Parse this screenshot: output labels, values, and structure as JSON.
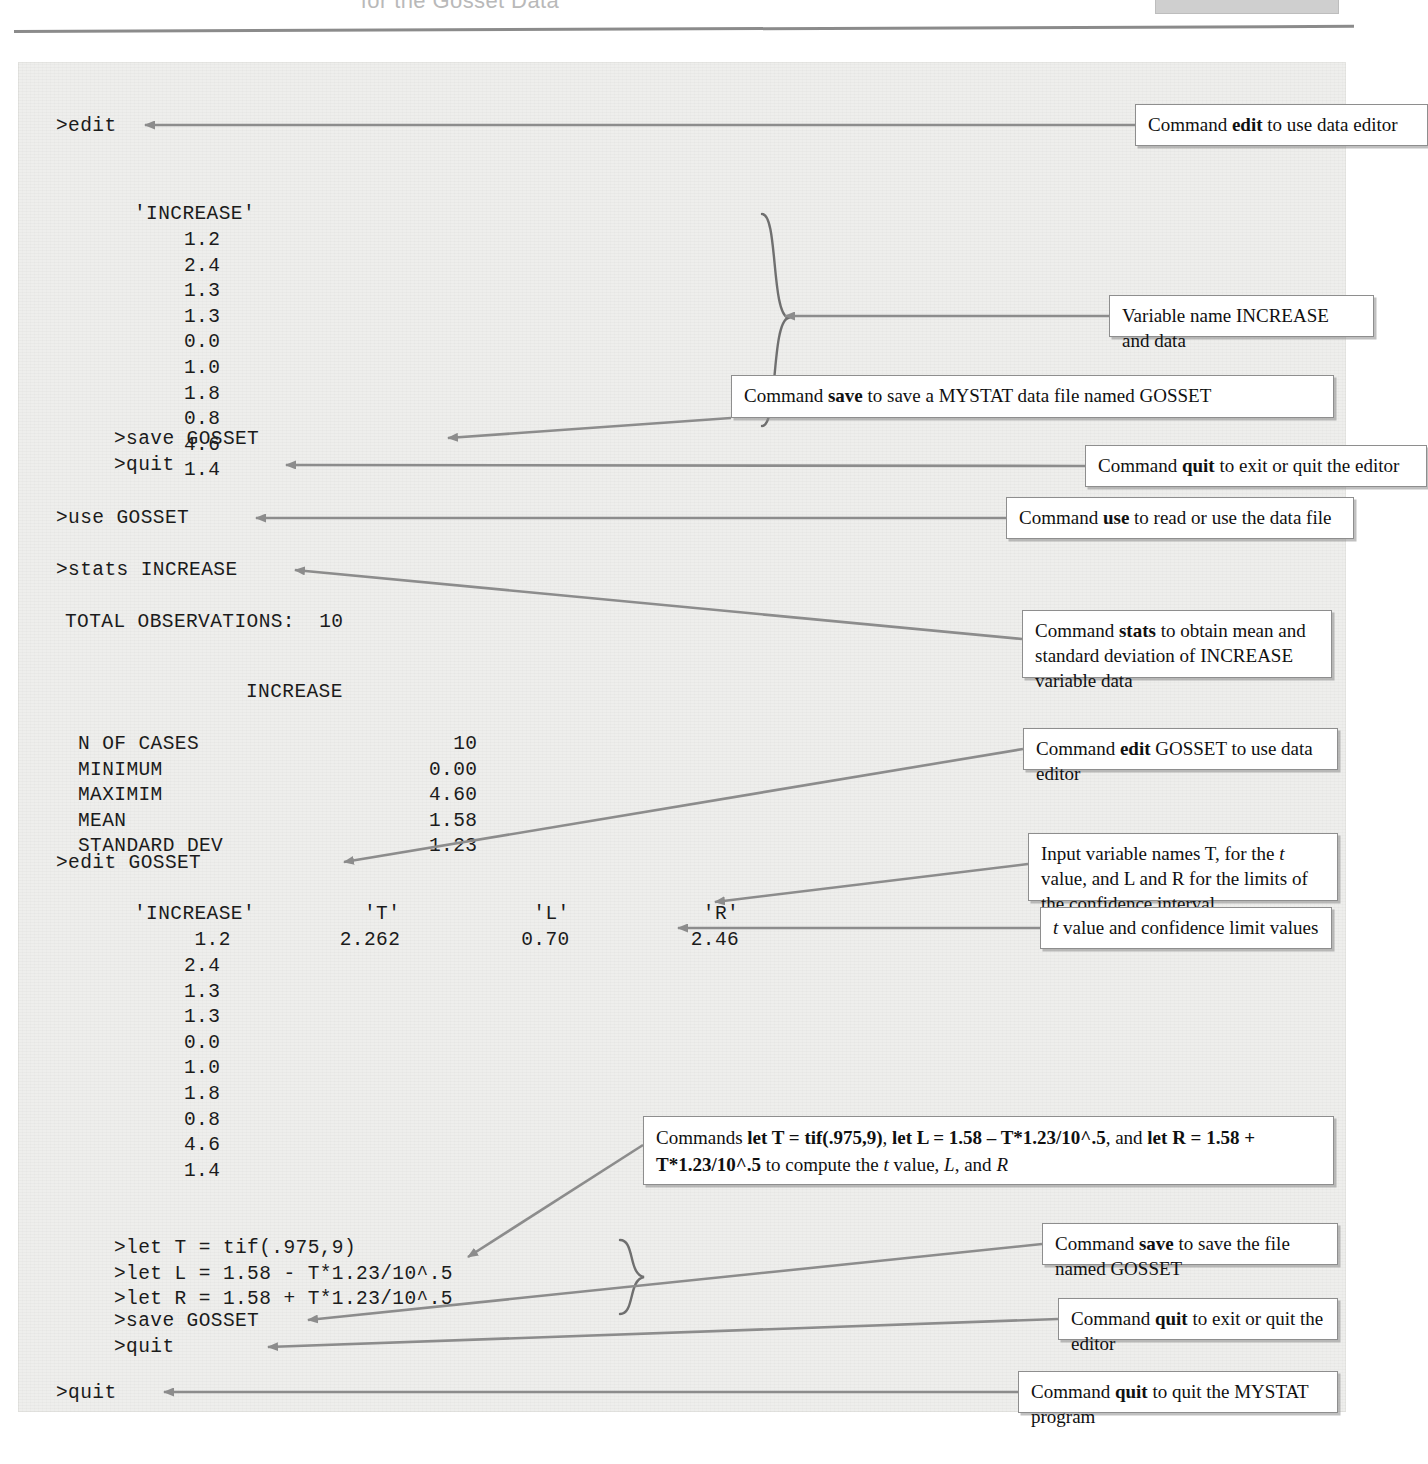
{
  "header": {
    "caption": "for the Gosset Data"
  },
  "terminal": {
    "line_edit": ">edit",
    "block1": {
      "header": "'INCREASE'",
      "values": [
        "1.2",
        "2.4",
        "1.3",
        "1.3",
        "0.0",
        "1.0",
        "1.8",
        "0.8",
        "4.6",
        "1.4"
      ]
    },
    "save_gosset_1": ">save GOSSET",
    "quit_1": ">quit",
    "use_gosset": ">use GOSSET",
    "stats_increase": ">stats INCREASE",
    "total_observations": "TOTAL OBSERVATIONS:  10",
    "stats_column_header": "INCREASE",
    "stats_rows": [
      {
        "label": "N OF CASES",
        "value": "10"
      },
      {
        "label": "MINIMUM",
        "value": "0.00"
      },
      {
        "label": "MAXIMIM",
        "value": "4.60"
      },
      {
        "label": "MEAN",
        "value": "1.58"
      },
      {
        "label": "STANDARD DEV",
        "value": "1.23"
      }
    ],
    "edit_gosset": ">edit GOSSET",
    "block2": {
      "headers": [
        "'INCREASE'",
        "'T'",
        "'L'",
        "'R'"
      ],
      "first_row": [
        "1.2",
        "2.262",
        "0.70",
        "2.46"
      ],
      "increase_rest": [
        "2.4",
        "1.3",
        "1.3",
        "0.0",
        "1.0",
        "1.8",
        "0.8",
        "4.6",
        "1.4"
      ]
    },
    "let_lines": [
      ">let T = tif(.975,9)",
      ">let L = 1.58 - T*1.23/10^.5",
      ">let R = 1.58 + T*1.23/10^.5"
    ],
    "save_gosset_2": ">save GOSSET",
    "quit_2": ">quit",
    "quit_3": ">quit"
  },
  "callouts": {
    "edit_editor": {
      "pre": "Command ",
      "cmd": "edit",
      "post": " to use data editor"
    },
    "variable_data": {
      "text": "Variable name INCREASE and data"
    },
    "save_mystat_file": {
      "pre": "Command ",
      "cmd": "save",
      "post": " to save a MYSTAT data file named GOSSET"
    },
    "quit_editor_1": {
      "pre": "Command ",
      "cmd": "quit",
      "post": " to exit or quit the editor"
    },
    "use_data_file": {
      "pre": "Command ",
      "cmd": "use",
      "post": " to read or use the data file"
    },
    "stats_mean_sd": {
      "pre": "Command ",
      "cmd": "stats",
      "post": " to obtain mean and standard deviation of INCREASE variable data"
    },
    "edit_gosset_editor": {
      "pre": "Command ",
      "cmd": "edit",
      "post": " GOSSET to use data editor"
    },
    "input_variable_names": {
      "seg1": "Input variable names T, for the ",
      "ital1": "t",
      "seg2": " value, and L and R for the limits of the confidence interval"
    },
    "t_and_limits": {
      "ital1": "t",
      "seg1": " value and confidence limit values"
    },
    "let_commands": {
      "seg1": "Commands ",
      "bold1": "let T = tif(.975,9)",
      "seg2": ", ",
      "bold2": "let L = 1.58 – T*1.23/10^.5",
      "seg3": ", and ",
      "bold3": "let R = 1.58 + T*1.23/10^.5",
      "seg4": " to compute the ",
      "ital1": "t",
      "seg5": " value, ",
      "ital2": "L",
      "seg6": ", and ",
      "ital3": "R"
    },
    "save_named_gosset": {
      "pre": "Command ",
      "cmd": "save",
      "post": " to save the file named GOSSET"
    },
    "quit_editor_2": {
      "pre": "Command ",
      "cmd": "quit",
      "post": " to exit or quit the editor"
    },
    "quit_program": {
      "pre": "Command ",
      "cmd": "quit",
      "post": " to quit the MYSTAT program"
    }
  },
  "colors": {
    "panel_bg": "#eeeeec",
    "connector": "#8c8c8c",
    "box_border": "#8e8e8e",
    "text": "#1b1b1b"
  }
}
